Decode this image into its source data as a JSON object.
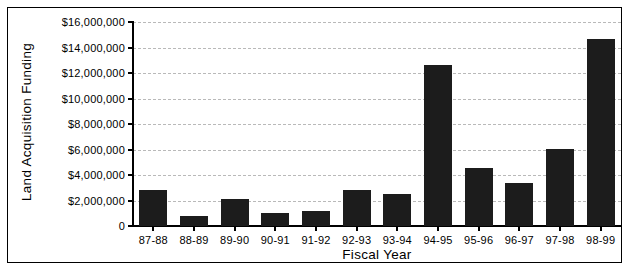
{
  "chart_data": {
    "type": "bar",
    "title": "",
    "xlabel": "Fiscal Year",
    "ylabel": "Land Acquisition Funding",
    "categories": [
      "87-88",
      "88-89",
      "89-90",
      "90-91",
      "91-92",
      "92-93",
      "93-94",
      "94-95",
      "95-96",
      "96-97",
      "97-98",
      "98-99"
    ],
    "values": [
      2850000,
      800000,
      2100000,
      1000000,
      1150000,
      2850000,
      2550000,
      12650000,
      4550000,
      3350000,
      6050000,
      14700000
    ],
    "ylim": [
      0,
      16000000
    ],
    "ytick_values": [
      0,
      2000000,
      4000000,
      6000000,
      8000000,
      10000000,
      12000000,
      14000000,
      16000000
    ],
    "ytick_labels": [
      "0",
      "$2,000,000",
      "$4,000,000",
      "$6,000,000",
      "$8,000,000",
      "$10,000,000",
      "$12,000,000",
      "$14,000,000",
      "$16,000,000"
    ],
    "grid": true,
    "grid_axis": "y",
    "legend": false,
    "bar_color": "#1c1c1c",
    "grid_color": "#b9b9b9",
    "axis_color": "#000000",
    "background_color": "#ffffff"
  }
}
